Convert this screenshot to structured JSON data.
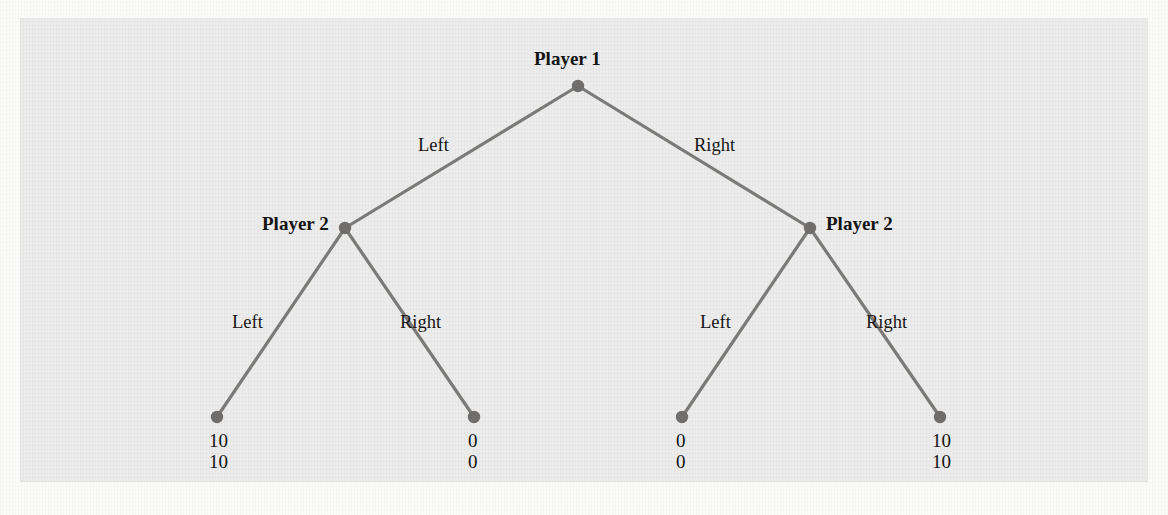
{
  "figure": {
    "panel_bg": "#ececec",
    "line_color": "#7b7a78",
    "node_color": "#6f6e6c",
    "text_color": "#141414"
  },
  "tree": {
    "root": {
      "player_label": "Player 1",
      "left_action": "Left",
      "right_action": "Right"
    },
    "left_subtree": {
      "player_label": "Player 2",
      "left_action": "Left",
      "right_action": "Right"
    },
    "right_subtree": {
      "player_label": "Player 2",
      "left_action": "Left",
      "right_action": "Right"
    },
    "outcomes": [
      {
        "id": "outcome-left-left",
        "p1": "10",
        "p2": "10"
      },
      {
        "id": "outcome-left-right",
        "p1": "0",
        "p2": "0"
      },
      {
        "id": "outcome-right-left",
        "p1": "0",
        "p2": "0"
      },
      {
        "id": "outcome-right-right",
        "p1": "10",
        "p2": "10"
      }
    ]
  },
  "chart_data": {
    "type": "diagram",
    "diagram_kind": "extensive-form-game-tree",
    "title": "",
    "nodes": [
      {
        "id": "n0",
        "label": "Player 1",
        "x": 578,
        "y": 86,
        "kind": "decision"
      },
      {
        "id": "n1",
        "label": "Player 2",
        "x": 345,
        "y": 228,
        "kind": "decision"
      },
      {
        "id": "n2",
        "label": "Player 2",
        "x": 810,
        "y": 228,
        "kind": "decision"
      },
      {
        "id": "t1",
        "label": "10,10",
        "x": 217,
        "y": 417,
        "kind": "terminal"
      },
      {
        "id": "t2",
        "label": "0,0",
        "x": 474,
        "y": 417,
        "kind": "terminal"
      },
      {
        "id": "t3",
        "label": "0,0",
        "x": 682,
        "y": 417,
        "kind": "terminal"
      },
      {
        "id": "t4",
        "label": "10,10",
        "x": 940,
        "y": 417,
        "kind": "terminal"
      }
    ],
    "edges": [
      {
        "from": "n0",
        "to": "n1",
        "label": "Left"
      },
      {
        "from": "n0",
        "to": "n2",
        "label": "Right"
      },
      {
        "from": "n1",
        "to": "t1",
        "label": "Left"
      },
      {
        "from": "n1",
        "to": "t2",
        "label": "Right"
      },
      {
        "from": "n2",
        "to": "t3",
        "label": "Left"
      },
      {
        "from": "n2",
        "to": "t4",
        "label": "Right"
      }
    ],
    "payoff_convention": "top number = Player 1 payoff, bottom number = Player 2 payoff"
  },
  "background_text": {
    "lines": [
      {
        "text": "Profit in games shown in such games a coalition set of possible perfect strategies A, a, b, B, H, are repre",
        "x": 54,
        "y": 262,
        "size": 15.5
      },
      {
        "text": "sented as payoff functions that gives a player as payoffs for any combination of actions taken by all the",
        "x": 50,
        "y": 285,
        "size": 15.5
      },
      {
        "text": "players. In a two-player game, we write that a player's payoff as a function to, and there u is a function",
        "x": 50,
        "y": 308,
        "size": 15.5
      },
      {
        "text": "that assigns a payoff value to u to an a combination of player 1 and player 2 actions, both of which are",
        "x": 50,
        "y": 331,
        "size": 15.5
      },
      {
        "text": "drawn from the interval [0,1] with x = 1,1 for both players.",
        "x": 50,
        "y": 354,
        "size": 15.5
      },
      {
        "text": "14.4 Use Games Theory for Sequential Move Games. Sequential-move games are often represented in such",
        "x": 50,
        "y": 432,
        "size": 15.5
      },
      {
        "text": "a form that clearly specify the sequence of moves prior to indicating the payoff each player receives at the",
        "x": 50,
        "y": 455,
        "size": 15.5
      },
      {
        "text": "Chapter",
        "x": 520,
        "y": 8,
        "size": 15.5
      },
      {
        "text": "Figure 14.1  A Sequential-Move Game",
        "x": 430,
        "y": 150,
        "size": 15.5
      }
    ]
  }
}
